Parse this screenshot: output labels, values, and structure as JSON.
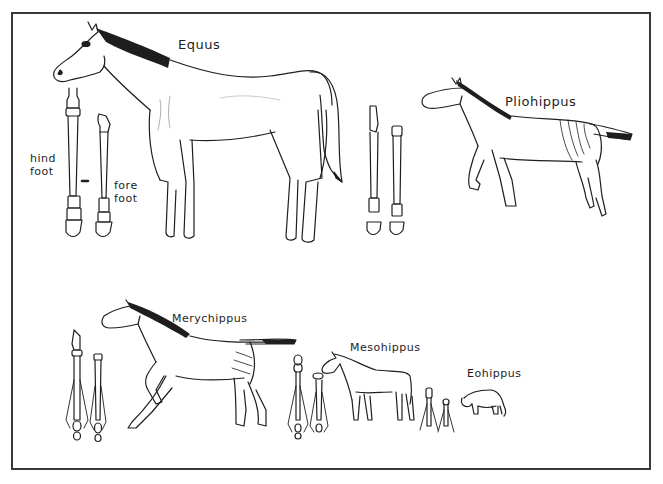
{
  "diagram": {
    "colors": {
      "ink": "#1e1e1e",
      "frame": "#3a3a3a",
      "background": "#ffffff"
    },
    "species": [
      {
        "id": "equus",
        "name": "Equus",
        "foot_labels": {
          "hind": "hind foot",
          "fore": "fore foot"
        }
      },
      {
        "id": "pliohippus",
        "name": "Pliohippus"
      },
      {
        "id": "merychippus",
        "name": "Merychippus"
      },
      {
        "id": "mesohippus",
        "name": "Mesohippus"
      },
      {
        "id": "eohippus",
        "name": "Eohippus"
      }
    ],
    "foot_labels": {
      "hind_line1": "hind",
      "hind_line2": "foot",
      "fore_line1": "fore",
      "fore_line2": "foot"
    }
  }
}
